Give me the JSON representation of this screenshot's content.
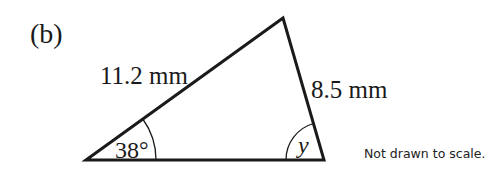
{
  "diagram": {
    "part_label": "(b)",
    "note": "Not drawn to scale.",
    "vertices": {
      "left": {
        "x": 86,
        "y": 160
      },
      "top": {
        "x": 283,
        "y": 18
      },
      "right": {
        "x": 324,
        "y": 160
      }
    },
    "sides": {
      "left_top": {
        "label": "11.2 mm",
        "value": 11.2,
        "unit": "mm"
      },
      "top_right": {
        "label": "8.5 mm",
        "value": 8.5,
        "unit": "mm"
      }
    },
    "angles": {
      "left": {
        "label": "38°",
        "value": 38
      },
      "right": {
        "label": "y",
        "variable": "y"
      }
    },
    "colors": {
      "line": "#1a1a1a",
      "text": "#1a1a1a",
      "background": "#ffffff"
    }
  }
}
